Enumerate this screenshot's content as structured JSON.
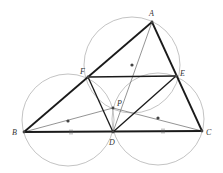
{
  "diagram": {
    "points": {
      "A": {
        "label": "A",
        "x": 152,
        "y": 22
      },
      "B": {
        "label": "B",
        "x": 24,
        "y": 132
      },
      "C": {
        "label": "C",
        "x": 202,
        "y": 131
      },
      "D": {
        "label": "D",
        "x": 113,
        "y": 132
      },
      "E": {
        "label": "E",
        "x": 176,
        "y": 76
      },
      "F": {
        "label": "F",
        "x": 88,
        "y": 77
      },
      "P": {
        "label": "P",
        "x": 113,
        "y": 108
      }
    },
    "circle_centers": [
      {
        "x": 132,
        "y": 65,
        "r": 48
      },
      {
        "x": 68,
        "y": 120,
        "r": 46
      },
      {
        "x": 158,
        "y": 119,
        "r": 46
      }
    ],
    "thick_segments": [
      "AB",
      "AC",
      "BC",
      "FE",
      "FD",
      "ED"
    ],
    "thin_segments": [
      "AD",
      "BP",
      "CP"
    ],
    "colors": {
      "thick": "#1a1a1a",
      "thin": "#555555",
      "circle": "#999999",
      "dot": "#444444"
    }
  }
}
